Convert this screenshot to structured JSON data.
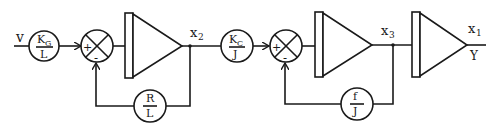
{
  "diagram": {
    "type": "block-diagram",
    "input_label": "v",
    "gain_blocks": [
      {
        "id": "kg-over-l",
        "numerator": "K",
        "numerator_sub": "G",
        "denominator": "L"
      },
      {
        "id": "r-over-l",
        "numerator": "R",
        "numerator_sub": "",
        "denominator": "L"
      },
      {
        "id": "kc-over-j",
        "numerator": "K",
        "numerator_sub": "C",
        "denominator": "J"
      },
      {
        "id": "f-over-j",
        "numerator": "f",
        "numerator_sub": "",
        "denominator": "J"
      }
    ],
    "summing_junctions": [
      {
        "id": "sum-1",
        "plus": "+",
        "minus": "-"
      },
      {
        "id": "sum-2",
        "plus": "+",
        "minus": "-"
      }
    ],
    "integrators": [
      "integrator-1",
      "integrator-2",
      "integrator-3"
    ],
    "signals": [
      {
        "id": "x2",
        "base": "x",
        "sub": "2"
      },
      {
        "id": "x3",
        "base": "x",
        "sub": "3"
      },
      {
        "id": "x1",
        "base": "x",
        "sub": "1"
      }
    ],
    "output_label": "Y"
  }
}
